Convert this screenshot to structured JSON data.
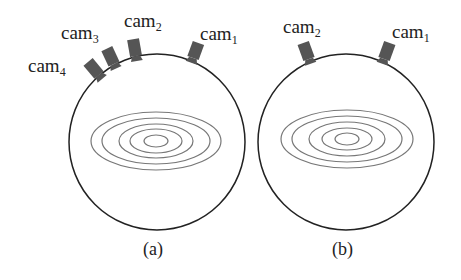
{
  "panels": [
    {
      "caption": "(a)",
      "cameras": [
        {
          "base": "cam",
          "sub": "1"
        },
        {
          "base": "cam",
          "sub": "2"
        },
        {
          "base": "cam",
          "sub": "3"
        },
        {
          "base": "cam",
          "sub": "4"
        }
      ]
    },
    {
      "caption": "(b)",
      "cameras": [
        {
          "base": "cam",
          "sub": "2"
        },
        {
          "base": "cam",
          "sub": "1"
        }
      ]
    }
  ],
  "colors": {
    "outline": "#222222",
    "camera": "#555555",
    "contour": "#777777"
  }
}
